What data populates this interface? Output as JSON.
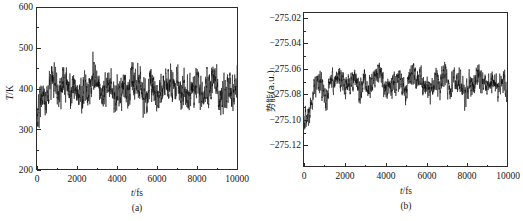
{
  "figure": {
    "background_color": "#ffffff",
    "ink_color": "#0d0d0d",
    "axis_color": "#2b2b2b"
  },
  "chart_data": [
    {
      "id": "panel-a",
      "type": "line",
      "title": "",
      "caption": "(a)",
      "xlabel_italic": "t",
      "xlabel_rest": "/fs",
      "xlabel": "t/fs",
      "ylabel_italic": "T",
      "ylabel_rest": "/K",
      "ylabel": "T/K",
      "xlim": [
        0,
        10000
      ],
      "ylim": [
        200,
        600
      ],
      "xticks": [
        0,
        2000,
        4000,
        6000,
        8000,
        10000
      ],
      "xtick_labels": [
        "0",
        "2000",
        "4000",
        "6000",
        "8000",
        "10000"
      ],
      "yticks": [
        200,
        300,
        400,
        500,
        600
      ],
      "ytick_labels": [
        "200",
        "300",
        "400",
        "500",
        "600"
      ],
      "grid": false,
      "legend": "none",
      "series_name": "temperature",
      "mean": 400,
      "noise_amplitude": 55,
      "envelope_amplitude": 45,
      "min_observed": 222,
      "max_observed": 592,
      "n_points": 2000,
      "description": "Molecular dynamics temperature fluctuation trace oscillating about 400 K"
    },
    {
      "id": "panel-b",
      "type": "line",
      "title": "",
      "caption": "(b)",
      "xlabel_italic": "t",
      "xlabel_rest": "/fs",
      "xlabel": "t/fs",
      "ylabel": "势能(a.u.)",
      "xlim": [
        0,
        10000
      ],
      "ylim": [
        -275.13,
        -275.012
      ],
      "xticks": [
        0,
        2000,
        4000,
        6000,
        8000,
        10000
      ],
      "xtick_labels": [
        "0",
        "2000",
        "4000",
        "6000",
        "8000",
        "10000"
      ],
      "yticks": [
        -275.02,
        -275.04,
        -275.06,
        -275.08,
        -275.1,
        -275.12
      ],
      "ytick_labels": [
        "−275.02",
        "−275.04",
        "−275.06",
        "−275.08",
        "−275.10",
        "−275.12"
      ],
      "grid": false,
      "legend": "none",
      "series_name": "potential-energy",
      "mean": -275.066,
      "noise_amplitude": 0.012,
      "envelope_amplitude": 0.014,
      "min_observed": -275.118,
      "max_observed": -275.018,
      "n_points": 2000,
      "description": "Molecular dynamics potential energy fluctuation trace drifting about -275.066 a.u."
    }
  ]
}
